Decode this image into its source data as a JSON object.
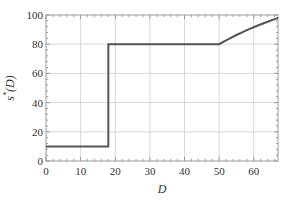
{
  "chart_data": {
    "type": "line",
    "title": "",
    "xlabel": "D",
    "ylabel": "s*(D)",
    "xlim": [
      0,
      67
    ],
    "ylim": [
      0,
      100
    ],
    "grid": true,
    "legend": null,
    "xticks": [
      0,
      10,
      20,
      30,
      40,
      50,
      60
    ],
    "yticks": [
      0,
      20,
      40,
      60,
      80,
      100
    ],
    "series": [
      {
        "name": "s*(D)",
        "color": "#555555",
        "x": [
          0,
          18,
          18,
          50,
          52,
          55,
          58,
          61,
          64,
          67
        ],
        "y": [
          10,
          10,
          80,
          80,
          82.7,
          86.3,
          89.6,
          92.6,
          95.4,
          98
        ]
      }
    ]
  },
  "axes": {
    "xlabel": "D",
    "ylabel_main": "s",
    "ylabel_sup": "*",
    "ylabel_arg": "(D)"
  }
}
